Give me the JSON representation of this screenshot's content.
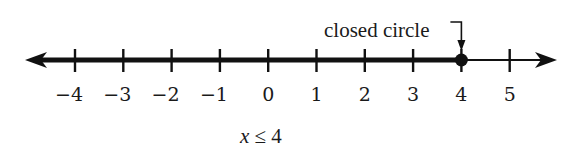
{
  "diagram": {
    "type": "number-line",
    "min": -4,
    "max": 5,
    "ticks": [
      -4,
      -3,
      -2,
      -1,
      0,
      1,
      2,
      3,
      4,
      5
    ],
    "tick_labels": [
      "−4",
      "−3",
      "−2",
      "−1",
      "0",
      "1",
      "2",
      "3",
      "4",
      "5"
    ],
    "endpoint": {
      "value": 4,
      "style": "closed"
    },
    "shaded_direction": "left",
    "callout": {
      "text": "closed circle",
      "target_value": 4
    },
    "inequality": "x ≤ 4",
    "colors": {
      "ink": "#111111"
    }
  }
}
